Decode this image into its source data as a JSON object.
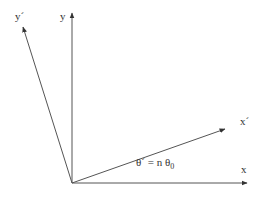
{
  "diagram": {
    "colors": {
      "line": "#555555",
      "text": "#333333",
      "background": "#ffffff"
    },
    "origin": {
      "x": 72,
      "y": 183
    },
    "axes": [
      {
        "id": "x",
        "label": "x",
        "end": {
          "x": 247,
          "y": 183
        }
      },
      {
        "id": "y",
        "label": "y",
        "end": {
          "x": 72,
          "y": 13
        }
      },
      {
        "id": "x_prime",
        "label": "x'",
        "end": {
          "x": 225,
          "y": 129
        }
      },
      {
        "id": "y_prime",
        "label": "y'",
        "end": {
          "x": 23,
          "y": 27
        }
      }
    ],
    "labels": {
      "x": "x",
      "y": "y",
      "x_prime": "x´",
      "y_prime": "y´",
      "angle_lhs": "θ´ = n θ",
      "angle_sub": "0"
    }
  }
}
